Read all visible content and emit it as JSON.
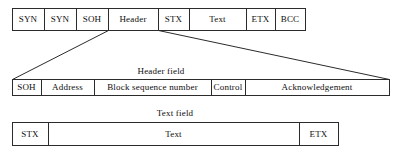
{
  "diagram": {
    "stroke_color": "#2b2b2b",
    "text_color": "#0d0d0d",
    "background_color": "#ffffff",
    "rows": [
      {
        "id": "frame-row",
        "name": "frame",
        "x": 12,
        "y": 8,
        "width": 293,
        "height": 22,
        "cells": [
          {
            "label": "SYN",
            "x": 12,
            "width": 32
          },
          {
            "label": "SYN",
            "x": 44,
            "width": 32
          },
          {
            "label": "SOH",
            "x": 76,
            "width": 32
          },
          {
            "label": "Header",
            "x": 108,
            "width": 50
          },
          {
            "label": "STX",
            "x": 158,
            "width": 31
          },
          {
            "label": "Text",
            "x": 189,
            "width": 57
          },
          {
            "label": "ETX",
            "x": 246,
            "width": 29
          },
          {
            "label": "BCC",
            "x": 275,
            "width": 30
          }
        ]
      },
      {
        "id": "header-row",
        "name": "header-field",
        "x": 12,
        "y": 79,
        "width": 377,
        "height": 16,
        "cells": [
          {
            "label": "SOH",
            "x": 12,
            "width": 29
          },
          {
            "label": "Address",
            "x": 41,
            "width": 53
          },
          {
            "label": "Block sequence number",
            "x": 94,
            "width": 117
          },
          {
            "label": "Control",
            "x": 211,
            "width": 34
          },
          {
            "label": "Acknowledgement",
            "x": 245,
            "width": 144
          }
        ]
      },
      {
        "id": "text-row",
        "name": "text-field",
        "x": 12,
        "y": 122,
        "width": 326,
        "height": 23,
        "cells": [
          {
            "label": "STX",
            "x": 12,
            "width": 36
          },
          {
            "label": "Text",
            "x": 48,
            "width": 251
          },
          {
            "label": "ETX",
            "x": 299,
            "width": 39
          }
        ]
      }
    ],
    "captions": [
      {
        "name": "header-field-caption",
        "text": "Header field",
        "cx": 161,
        "cy": 71
      },
      {
        "name": "text-field-caption",
        "text": "Text field",
        "cx": 175,
        "cy": 113
      }
    ],
    "connectors": [
      {
        "name": "header-expand-left",
        "x1": 108,
        "y1": 30,
        "x2": 12,
        "y2": 79
      },
      {
        "name": "header-expand-right",
        "x1": 158,
        "y1": 30,
        "x2": 389,
        "y2": 79
      }
    ]
  }
}
